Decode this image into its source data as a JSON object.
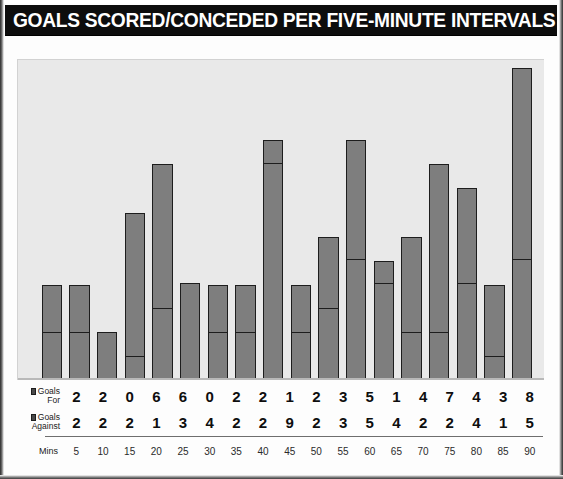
{
  "header": {
    "title": "GOALS SCORED/CONCEDED PER FIVE-MINUTE INTERVALS"
  },
  "legend": {
    "goals_for_line1": "Goals",
    "goals_for_line2": "For",
    "goals_against_line1": "Goals",
    "goals_against_line2": "Against",
    "mins_label": "Mins"
  },
  "colors": {
    "title_background": "#0d0d0d",
    "title_text": "#ffffff",
    "plot_background": "#e9e9e9",
    "bar_fill": "#7e7e7e",
    "bar_border": "#1d1d1d",
    "baseline": "#b9b9b9",
    "table_rule": "#6e6e6e"
  },
  "chart_data": {
    "type": "bar",
    "title": "GOALS SCORED/CONCEDED PER FIVE-MINUTE INTERVALS",
    "subtitle": "",
    "xlabel": "Mins",
    "ylabel": "",
    "stacked": true,
    "grid": false,
    "legend_position": "left-table",
    "ylim": [
      0,
      13
    ],
    "categories": [
      "5",
      "10",
      "15",
      "20",
      "25",
      "30",
      "35",
      "40",
      "45",
      "50",
      "55",
      "60",
      "65",
      "70",
      "75",
      "80",
      "85",
      "90"
    ],
    "series": [
      {
        "name": "Goals For",
        "values": [
          2,
          2,
          0,
          6,
          6,
          0,
          2,
          2,
          1,
          2,
          3,
          5,
          1,
          4,
          7,
          4,
          3,
          8
        ]
      },
      {
        "name": "Goals Against",
        "values": [
          2,
          2,
          2,
          1,
          3,
          4,
          2,
          2,
          9,
          2,
          3,
          5,
          4,
          2,
          2,
          4,
          1,
          5
        ]
      }
    ],
    "totals": [
      4,
      4,
      2,
      7,
      9,
      4,
      4,
      4,
      10,
      4,
      6,
      10,
      5,
      6,
      9,
      8,
      4,
      13
    ]
  }
}
